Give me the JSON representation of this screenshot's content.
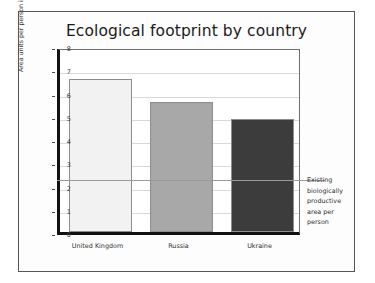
{
  "chart_data": {
    "type": "bar",
    "title": "Ecological footprint by country",
    "xlabel": "",
    "ylabel": "Area units per person in 1996",
    "categories": [
      "United Kingdom",
      "Russia",
      "Ukraine"
    ],
    "values": [
      6.6,
      5.6,
      4.85
    ],
    "bar_colors": [
      "#f2f2f2",
      "#a8a8a8",
      "#3c3c3c"
    ],
    "ylim": [
      0,
      8
    ],
    "ytick_labels": [
      "0",
      "1",
      "2",
      "3",
      "4",
      "5",
      "6",
      "7",
      "8"
    ],
    "grid": true,
    "legend": "none",
    "reference_line": {
      "value": 2.35,
      "color": "#9a9a9a",
      "label_lines": [
        "Existing",
        "biologically",
        "productive",
        "area per",
        "person"
      ]
    }
  }
}
